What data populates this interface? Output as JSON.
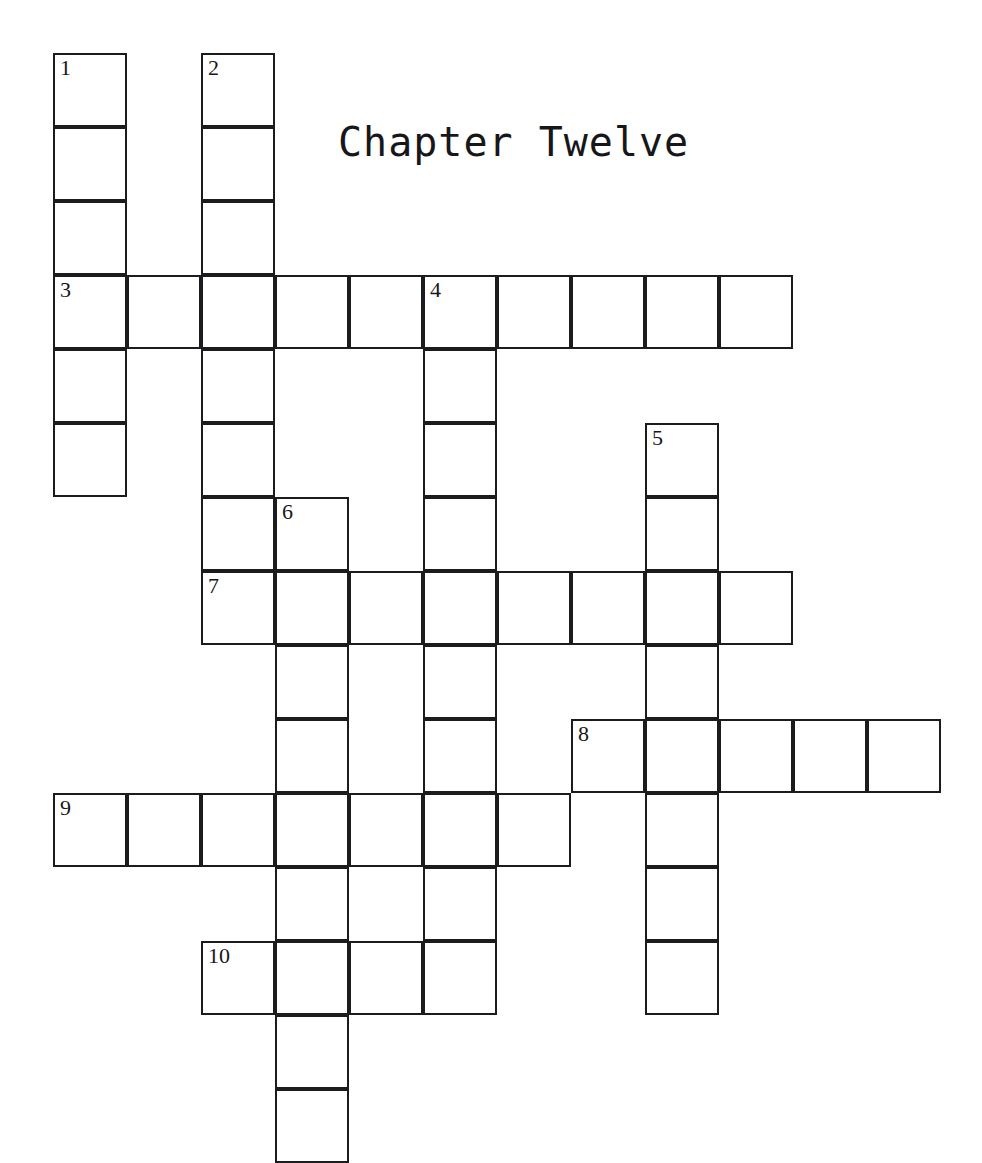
{
  "page": {
    "width": 982,
    "height": 1161,
    "background_color": "#ffffff",
    "ink_color": "#1c1c1f"
  },
  "title": {
    "text": "Chapter Twelve",
    "x": 338,
    "y": 122,
    "font_size": 40
  },
  "grid": {
    "cell_size": 74,
    "origin_x": 53,
    "origin_y": 53,
    "columns": 13,
    "rows": 15,
    "border_width": 2,
    "cell_fill": "#ffffff",
    "border_color": "#1c1c1f"
  },
  "entries": [
    {
      "number": "1",
      "direction": "down",
      "col": 1,
      "row": 1,
      "length": 6
    },
    {
      "number": "2",
      "direction": "down",
      "col": 3,
      "row": 1,
      "length": 7
    },
    {
      "number": "3",
      "direction": "across",
      "col": 1,
      "row": 4,
      "length": 10
    },
    {
      "number": "4",
      "direction": "down",
      "col": 6,
      "row": 4,
      "length": 9
    },
    {
      "number": "5",
      "direction": "down",
      "col": 9,
      "row": 6,
      "length": 8
    },
    {
      "number": "6",
      "direction": "down",
      "col": 4,
      "row": 7,
      "length": 9
    },
    {
      "number": "7",
      "direction": "across",
      "col": 3,
      "row": 8,
      "length": 8
    },
    {
      "number": "8",
      "direction": "across",
      "col": 8,
      "row": 10,
      "length": 5
    },
    {
      "number": "9",
      "direction": "across",
      "col": 1,
      "row": 11,
      "length": 7
    },
    {
      "number": "10",
      "direction": "across",
      "col": 3,
      "row": 13,
      "length": 4
    }
  ],
  "numbered_cells": [
    {
      "number": "1",
      "col": 1,
      "row": 1
    },
    {
      "number": "2",
      "col": 3,
      "row": 1
    },
    {
      "number": "3",
      "col": 1,
      "row": 4
    },
    {
      "number": "4",
      "col": 6,
      "row": 4
    },
    {
      "number": "5",
      "col": 9,
      "row": 6
    },
    {
      "number": "6",
      "col": 4,
      "row": 7
    },
    {
      "number": "7",
      "col": 3,
      "row": 8
    },
    {
      "number": "8",
      "col": 8,
      "row": 10
    },
    {
      "number": "9",
      "col": 1,
      "row": 11
    },
    {
      "number": "10",
      "col": 3,
      "row": 13
    }
  ],
  "filled_letters": []
}
